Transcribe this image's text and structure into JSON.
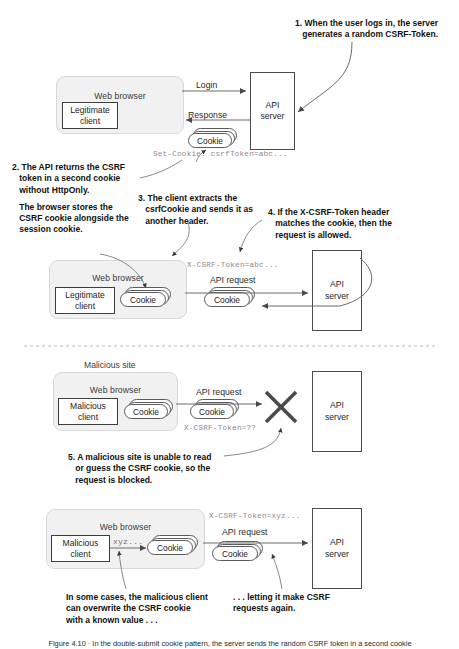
{
  "figure": {
    "caption": "Figure 4.10 · In the double-submit cookie pattern, the server sends the random CSRF token in a second cookie"
  },
  "labels": {
    "web_browser": "Web browser",
    "legitimate_client": "Legitimate\nclient",
    "malicious_client": "Malicious\nclient",
    "api_server": "API\nserver",
    "cookie": "Cookie",
    "malicious_site": "Malicious site"
  },
  "panel1": {
    "flow_login": "Login",
    "flow_response": "Response",
    "set_cookie_header": "Set-Cookie: csrfToken=abc...",
    "step1": "1. When the user logs in, the server generates a random CSRF-Token.",
    "step2a": "2. The API returns the CSRF token in a second cookie without HttpOnly.",
    "step2b": "The browser stores the CSRF cookie alongside the session cookie."
  },
  "panel2": {
    "flow_api_request": "API request",
    "csrf_header": "X-CSRF-Token=abc...",
    "step3": "3. The client extracts the csrfCookie and sends it as another header.",
    "step4": "4. If the X-CSRF-Token header matches the cookie, then the request is allowed."
  },
  "panel3": {
    "flow_api_request": "API request",
    "csrf_header": "X-CSRF-Token=??",
    "step5": "5. A malicious site is unable to read or guess the CSRF cookie, so the request is blocked."
  },
  "panel4": {
    "flow_api_request": "API request",
    "csrf_header": "X-CSRF-Token=xyz...",
    "overwrite_value": "xyz...",
    "note_left": "In some cases, the malicious client can overwrite the CSRF cookie with a known value . . .",
    "note_right": ". . . letting it make CSRF requests again."
  },
  "colors": {
    "browser_fill": "#f1f1f1",
    "browser_stroke": "#d8d8d8",
    "box_stroke": "#3d3d3d",
    "arrow": "#4a4a4a",
    "mono_text": "#8b8b8b",
    "block_x": "#4a4a4a"
  }
}
